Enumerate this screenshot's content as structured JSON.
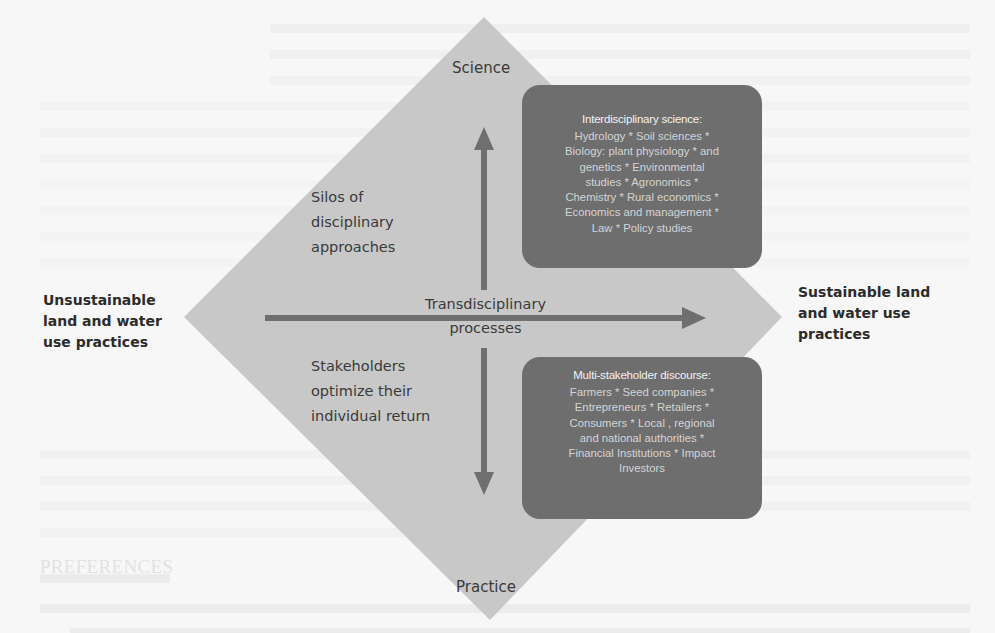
{
  "background_page": {
    "visible_fragments": [
      "PREFERENCES",
      "Aron, ... 2001 ... Practice Plus ... Practice ..."
    ]
  },
  "diagram": {
    "axis_labels": {
      "top": "Science",
      "bottom": "Practice",
      "left": [
        "Unsustainable",
        "land and water",
        "use practices"
      ],
      "right": [
        "Sustainable land",
        "and water use",
        "practices"
      ]
    },
    "center_label": [
      "Transdisciplinary",
      "processes"
    ],
    "upper_left_label": [
      "Silos of",
      "disciplinary",
      "approaches"
    ],
    "lower_left_label": [
      "Stakeholders",
      "optimize their",
      "individual return"
    ],
    "boxes": [
      {
        "title": "Interdisciplinary science:",
        "lines": [
          "Hydrology * Soil sciences *",
          "Biology: plant physiology * and",
          "genetics * Environmental",
          "studies * Agronomics *",
          "Chemistry * Rural economics *",
          "Economics and management *",
          "Law * Policy studies"
        ]
      },
      {
        "title": "Multi-stakeholder discourse:",
        "lines": [
          "Farmers * Seed companies *",
          "Entrepreneurs * Retailers *",
          "Consumers * Local , regional",
          "and national authorities *",
          "Financial Institutions * Impact",
          "Investors"
        ]
      }
    ],
    "colors": {
      "diamond_fill": "#c8c8c8",
      "arrow": "#6f6f6f",
      "box_fill": "#6e6e6e",
      "box_text": "#d4d4d4",
      "label_text": "#3a3a3a"
    }
  }
}
